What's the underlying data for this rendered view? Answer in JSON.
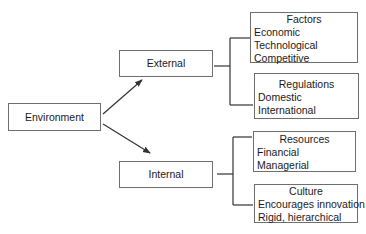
{
  "diagram": {
    "root": {
      "label": "Environment"
    },
    "branches": [
      {
        "label": "External",
        "groups": [
          {
            "title": "Factors",
            "items": [
              "Economic",
              "Technological",
              "Competitive"
            ]
          },
          {
            "title": "Regulations",
            "items": [
              "Domestic",
              "International"
            ]
          }
        ]
      },
      {
        "label": "Internal",
        "groups": [
          {
            "title": "Resources",
            "items": [
              "Financial",
              "Managerial"
            ]
          },
          {
            "title": "Culture",
            "items": [
              "Encourages innovation",
              "Rigid, hierarchical"
            ]
          }
        ]
      }
    ]
  },
  "colors": {
    "line": "#333333",
    "border": "#6e6e6e",
    "background": "#ffffff"
  }
}
